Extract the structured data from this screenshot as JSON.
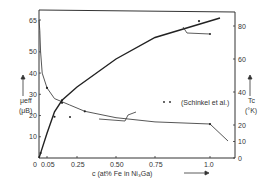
{
  "chart_data": {
    "type": "line",
    "title": "",
    "xlabel": "c (at% Fe in Ni3Ga)",
    "ylabel_left": "μeff (μB)",
    "ylabel_right": "Tc (°K)",
    "x_ticks": [
      "0",
      "0.05",
      "0.25",
      "0.50",
      "0.75",
      "1.0"
    ],
    "x_tick_values": [
      0,
      0.05,
      0.25,
      0.5,
      0.75,
      1.0
    ],
    "y_left_ticks": [
      "10",
      "20",
      "30",
      "40",
      "50",
      "65"
    ],
    "y_left_tick_values": [
      10,
      20,
      30,
      40,
      50,
      65
    ],
    "y_right_ticks": [
      "0",
      "10",
      "20",
      "40",
      "60",
      "80"
    ],
    "y_right_tick_values": [
      0,
      10,
      20,
      40,
      60,
      80
    ],
    "xlim": [
      0,
      1.1
    ],
    "ylim_left": [
      0,
      70
    ],
    "ylim_right": [
      0,
      90
    ],
    "grid": false,
    "legend": {
      "position": "right-middle",
      "entries": [
        "(Schinkel et al.)"
      ]
    },
    "series": [
      {
        "name": "μeff (left axis)",
        "axis": "left",
        "x": [
          0.0,
          0.005,
          0.01,
          0.02,
          0.05,
          0.1,
          0.2,
          0.3,
          0.5,
          0.75,
          1.0
        ],
        "values": [
          65,
          60,
          50,
          40,
          33,
          28,
          25,
          22,
          19,
          17,
          16
        ]
      },
      {
        "name": "Tc (right axis)",
        "axis": "right",
        "x": [
          0.0,
          0.01,
          0.05,
          0.1,
          0.15,
          0.25,
          0.5,
          0.75,
          1.0
        ],
        "values": [
          0,
          3,
          15,
          28,
          35,
          43,
          60,
          73,
          83
        ]
      }
    ],
    "annotations": [
      {
        "text": "arrow pointing to right axis from Tc curve",
        "near_x": 0.95
      },
      {
        "text": "arrow pointing to left axis from μeff curve",
        "near_x": 0.35
      },
      {
        "text": "• • (Schinkel et al.)",
        "type": "legend"
      }
    ]
  },
  "labels": {
    "xlabel": "c (at% Fe in Ni₃Ga)",
    "ylabel_left_1": "μeff",
    "ylabel_left_2": "(μB)",
    "ylabel_right_1": "Tc",
    "ylabel_right_2": "(°K)",
    "legend": "(Schinkel et al.)"
  }
}
